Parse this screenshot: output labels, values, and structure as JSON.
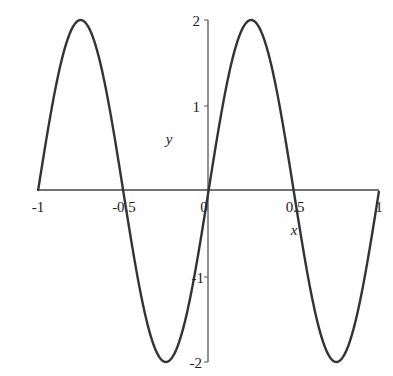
{
  "chart_data": {
    "type": "line",
    "title": "",
    "xlabel": "x",
    "ylabel": "y",
    "xlim": [
      -1,
      1
    ],
    "ylim": [
      -2,
      2
    ],
    "grid": false,
    "legend": null,
    "function": "y = 2 sin(2πx)",
    "x_ticks": [
      "-1",
      "-0.5",
      "0",
      "0.5",
      "1"
    ],
    "y_ticks": [
      "2",
      "1",
      "-1",
      "-2"
    ],
    "series": [
      {
        "name": "curve",
        "x": [
          -1,
          -0.875,
          -0.75,
          -0.625,
          -0.5,
          -0.375,
          -0.25,
          -0.125,
          0,
          0.125,
          0.25,
          0.375,
          0.5,
          0.625,
          0.75,
          0.875,
          1
        ],
        "values": [
          0,
          1.414,
          2,
          1.414,
          0,
          -1.414,
          -2,
          -1.414,
          0,
          1.414,
          2,
          1.414,
          0,
          -1.414,
          -2,
          -1.414,
          0
        ]
      }
    ],
    "colors": {
      "curve": "#333333",
      "axes": "#444444"
    }
  }
}
